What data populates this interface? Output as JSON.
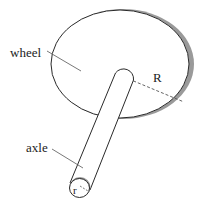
{
  "diagram": {
    "labels": {
      "wheel": "wheel",
      "axle": "axle",
      "wheel_radius": "R",
      "axle_radius": "r"
    },
    "colors": {
      "stroke": "#2a2a2a",
      "rim_shade": "#9a9a9a",
      "leader": "#555555",
      "fill": "#ffffff"
    }
  }
}
